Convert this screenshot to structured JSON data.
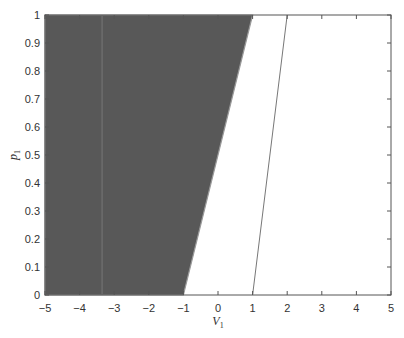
{
  "chart_data": {
    "type": "area",
    "title": "",
    "xlabel": "V",
    "xlabel_subscript": "1",
    "ylabel": "p",
    "ylabel_subscript": "1",
    "xlim": [
      -5,
      5
    ],
    "ylim": [
      0,
      1
    ],
    "xticks": [
      -5,
      -4,
      -3,
      -2,
      -1,
      0,
      1,
      2,
      3,
      4,
      5
    ],
    "yticks": [
      0,
      0.1,
      0.2,
      0.3,
      0.4,
      0.5,
      0.6,
      0.7,
      0.8,
      0.9,
      1
    ],
    "xtick_labels": [
      "−5",
      "−4",
      "−3",
      "−2",
      "−1",
      "0",
      "1",
      "2",
      "3",
      "4",
      "5"
    ],
    "ytick_labels": [
      "0",
      "0.1",
      "0.2",
      "0.3",
      "0.4",
      "0.5",
      "0.6",
      "0.7",
      "0.8",
      "0.9",
      "1"
    ],
    "grid": false,
    "legend": null,
    "series": [
      {
        "name": "shaded region",
        "kind": "filled_polygon",
        "color": "#585858",
        "points": [
          [
            -5,
            0
          ],
          [
            -1,
            0
          ],
          [
            1,
            1
          ],
          [
            -5,
            1
          ]
        ]
      },
      {
        "name": "boundary line",
        "kind": "line",
        "color": "#777777",
        "points": [
          [
            1,
            0
          ],
          [
            2,
            1
          ]
        ]
      }
    ]
  },
  "colors": {
    "fill": "#585858",
    "axis": "#555555",
    "line": "#777777"
  }
}
